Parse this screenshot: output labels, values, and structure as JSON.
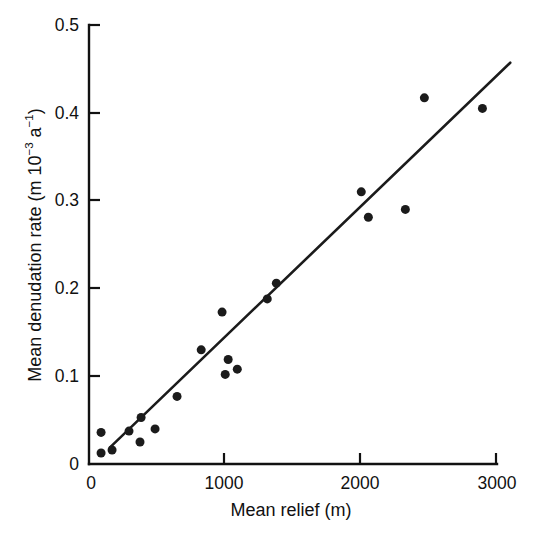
{
  "figure": {
    "background_color": "#ffffff",
    "ink_color": "#1b1b1b"
  },
  "chart_data": {
    "type": "scatter",
    "title": "",
    "xlabel": "Mean relief (m)",
    "ylabel": "Mean denudation rate (m 10-3 a-1)",
    "ylabel_parts": {
      "prefix": "Mean denudation rate (m 10",
      "exp1": "−3",
      "mid": " a",
      "exp2": "−1",
      "suffix": ")"
    },
    "xlim": [
      0,
      3000
    ],
    "ylim": [
      0,
      0.5
    ],
    "xticks": [
      0,
      1000,
      2000,
      3000
    ],
    "xtick_labels": [
      "0",
      "1000",
      "2000",
      "3000"
    ],
    "yticks": [
      0,
      0.1,
      0.2,
      0.3,
      0.4,
      0.5
    ],
    "ytick_labels": [
      "0",
      "0.1",
      "0.2",
      "0.3",
      "0.4",
      "0.5"
    ],
    "grid": false,
    "legend": false,
    "marker": "filled-circle",
    "marker_size_px": 9,
    "x": [
      89,
      89,
      170,
      295,
      376,
      384,
      487,
      649,
      827,
      981,
      1004,
      1026,
      1093,
      1314,
      1381,
      2007,
      2059,
      2332,
      2472,
      2900
    ],
    "y": [
      0.036,
      0.0125,
      0.016,
      0.0375,
      0.025,
      0.053,
      0.04,
      0.077,
      0.13,
      0.173,
      0.102,
      0.119,
      0.108,
      0.188,
      0.206,
      0.31,
      0.281,
      0.29,
      0.417,
      0.405
    ],
    "points": [
      {
        "x": 89,
        "y": 0.036
      },
      {
        "x": 89,
        "y": 0.0125
      },
      {
        "x": 170,
        "y": 0.016
      },
      {
        "x": 295,
        "y": 0.0375
      },
      {
        "x": 376,
        "y": 0.025
      },
      {
        "x": 384,
        "y": 0.053
      },
      {
        "x": 487,
        "y": 0.04
      },
      {
        "x": 649,
        "y": 0.077
      },
      {
        "x": 827,
        "y": 0.13
      },
      {
        "x": 981,
        "y": 0.173
      },
      {
        "x": 1004,
        "y": 0.102
      },
      {
        "x": 1026,
        "y": 0.119
      },
      {
        "x": 1093,
        "y": 0.108
      },
      {
        "x": 1314,
        "y": 0.188
      },
      {
        "x": 1381,
        "y": 0.206
      },
      {
        "x": 2007,
        "y": 0.31
      },
      {
        "x": 2059,
        "y": 0.281
      },
      {
        "x": 2332,
        "y": 0.29
      },
      {
        "x": 2472,
        "y": 0.417
      },
      {
        "x": 2900,
        "y": 0.405
      }
    ],
    "trend_line": {
      "label": "regression line",
      "x_start": 155,
      "y_start": 0.019,
      "x_end": 3105,
      "y_end": 0.457
    }
  }
}
